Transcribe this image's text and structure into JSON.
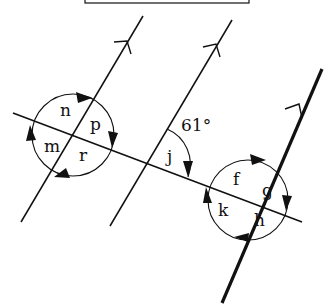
{
  "diagram": {
    "title_box": "",
    "colors": {
      "line": "#111111",
      "background": "#ffffff"
    },
    "angle_given": "61°",
    "labels": {
      "left_intersection": {
        "n": "n",
        "p": "p",
        "m": "m",
        "r": "r"
      },
      "middle_intersection": {
        "j": "j"
      },
      "right_intersection": {
        "f": "f",
        "g": "g",
        "k": "k",
        "h": "h"
      }
    },
    "lines": [
      {
        "name": "parallel-line-1",
        "has_arrow": true
      },
      {
        "name": "parallel-line-2",
        "has_arrow": true
      },
      {
        "name": "parallel-line-3-bold",
        "has_arrow": true
      },
      {
        "name": "transversal",
        "has_arrow": false
      }
    ]
  }
}
